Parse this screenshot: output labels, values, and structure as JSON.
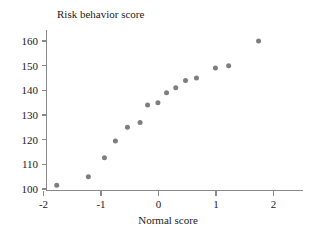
{
  "chart_data": {
    "type": "scatter",
    "title": "",
    "xlabel": "Normal score",
    "ylabel": "Risk behavior score",
    "xlim": [
      -2.35,
      2.55
    ],
    "ylim": [
      97.5,
      163.5
    ],
    "grid": false,
    "legend": "none",
    "xticks": [
      "-2",
      "-1",
      "0",
      "1",
      "2"
    ],
    "xtick_values": [
      -2,
      -1,
      0,
      1,
      2
    ],
    "yticks": [
      "100",
      "110",
      "120",
      "130",
      "140",
      "150",
      "160"
    ],
    "ytick_values": [
      100,
      110,
      120,
      130,
      140,
      150,
      160
    ],
    "marker": "filled-circle",
    "marker_color": "#7e7e7e",
    "marker_size": 5,
    "x": [
      -1.77,
      -1.22,
      -0.94,
      -0.75,
      -0.54,
      -0.32,
      -0.19,
      -0.01,
      0.14,
      0.3,
      0.47,
      0.66,
      0.99,
      1.22,
      1.74
    ],
    "y": [
      101.5,
      105,
      112.7,
      119.5,
      125,
      127,
      134,
      135,
      139,
      141,
      144,
      145,
      149,
      150,
      160
    ],
    "points": [
      {
        "x": -1.77,
        "y": 101.5
      },
      {
        "x": -1.22,
        "y": 105
      },
      {
        "x": -0.94,
        "y": 112.7
      },
      {
        "x": -0.75,
        "y": 119.5
      },
      {
        "x": -0.54,
        "y": 125
      },
      {
        "x": -0.32,
        "y": 127
      },
      {
        "x": -0.19,
        "y": 134
      },
      {
        "x": -0.01,
        "y": 135
      },
      {
        "x": 0.14,
        "y": 139
      },
      {
        "x": 0.3,
        "y": 141
      },
      {
        "x": 0.47,
        "y": 144
      },
      {
        "x": 0.66,
        "y": 145
      },
      {
        "x": 0.99,
        "y": 149
      },
      {
        "x": 1.22,
        "y": 150
      },
      {
        "x": 1.74,
        "y": 160
      }
    ]
  },
  "axes": {
    "y_title": "Risk behavior score",
    "x_title": "Normal score"
  },
  "colors": {
    "marker": "#7e7e7e",
    "axis": "#8a8a8a",
    "text": "#1a1a1a",
    "background": "#ffffff"
  }
}
